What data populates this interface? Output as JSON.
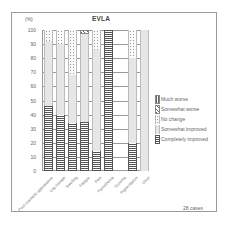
{
  "chart_data": {
    "type": "bar",
    "stacked": true,
    "title": "EVLA",
    "xlabel": "",
    "ylabel": "(%)",
    "ylim": [
      0,
      100
    ],
    "yticks": [
      0,
      10,
      20,
      30,
      40,
      50,
      60,
      70,
      80,
      90,
      100
    ],
    "grid": true,
    "legend_position": "right",
    "annotation": "28 cases",
    "categories": [
      "Poor cosmetic appearance",
      "Leg cramps",
      "Swelling",
      "Fatigue",
      "Pain",
      "Paresthesia",
      "Eczema",
      "Pigmentation",
      "Ulcer"
    ],
    "series": [
      {
        "name": "Completely improved",
        "key": "ci",
        "values": [
          46,
          40,
          34,
          35,
          14,
          100,
          0,
          20,
          0
        ]
      },
      {
        "name": "Somewhat improved",
        "key": "si",
        "values": [
          46,
          50,
          34,
          62,
          72,
          0,
          0,
          60,
          100
        ]
      },
      {
        "name": "No change",
        "key": "nc",
        "values": [
          8,
          10,
          32,
          0,
          14,
          0,
          0,
          20,
          0
        ]
      },
      {
        "name": "Somewhat worse",
        "key": "sw",
        "values": [
          0,
          0,
          0,
          3,
          0,
          0,
          0,
          0,
          0
        ]
      },
      {
        "name": "Much worse",
        "key": "mw",
        "values": [
          0,
          0,
          0,
          0,
          0,
          0,
          0,
          0,
          0
        ]
      }
    ]
  },
  "header": {
    "unit": "(%)",
    "title": "EVLA"
  },
  "yaxis": {
    "ticks": [
      "100",
      "90",
      "80",
      "70",
      "60",
      "50",
      "40",
      "30",
      "20",
      "10",
      "0"
    ]
  },
  "legend": {
    "items": [
      {
        "label": "Much worse",
        "pattern": "mw"
      },
      {
        "label": "Somewhat worse",
        "pattern": "sw"
      },
      {
        "label": "No change",
        "pattern": "nc"
      },
      {
        "label": "Somewhat improved",
        "pattern": "si"
      },
      {
        "label": "Completely improved",
        "pattern": "ci"
      }
    ]
  },
  "footer": {
    "cases": "28 cases"
  }
}
